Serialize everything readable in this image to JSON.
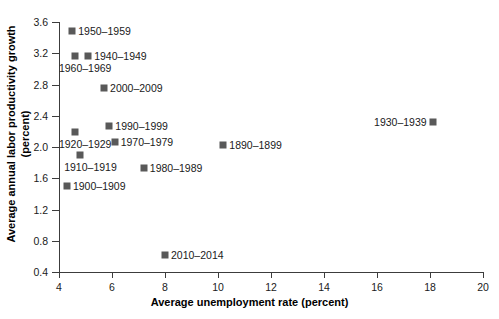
{
  "chart_data": {
    "type": "scatter",
    "title": "",
    "xlabel": "Average unemployment rate (percent)",
    "ylabel": "Average annual labor productivity growth (percent)",
    "xlim": [
      4,
      20
    ],
    "ylim": [
      0.4,
      3.6
    ],
    "xticks": [
      "4",
      "6",
      "8",
      "10",
      "12",
      "14",
      "16",
      "18",
      "20"
    ],
    "xtick_values": [
      4,
      6,
      8,
      10,
      12,
      14,
      16,
      18,
      20
    ],
    "yticks": [
      "0.4",
      "0.8",
      "1.2",
      "1.6",
      "2.0",
      "2.4",
      "2.8",
      "3.2",
      "3.6"
    ],
    "ytick_values": [
      0.4,
      0.8,
      1.2,
      1.6,
      2.0,
      2.4,
      2.8,
      3.2,
      3.6
    ],
    "grid": false,
    "legend": "none",
    "marker_color": "#595959",
    "axis_color": "#3c3c3c",
    "points": [
      {
        "label": "1950–1959",
        "x": 4.5,
        "y": 3.48,
        "label_side": "right"
      },
      {
        "label": "1940–1949",
        "x": 5.1,
        "y": 3.17,
        "label_side": "right"
      },
      {
        "label": "1960–1969",
        "x": 4.6,
        "y": 3.17,
        "label_side": "below"
      },
      {
        "label": "2000–2009",
        "x": 5.7,
        "y": 2.75,
        "label_side": "right"
      },
      {
        "label": "1990–1999",
        "x": 5.9,
        "y": 2.27,
        "label_side": "right"
      },
      {
        "label": "1970–1979",
        "x": 6.1,
        "y": 2.06,
        "label_side": "right"
      },
      {
        "label": "1920–1929",
        "x": 4.6,
        "y": 2.19,
        "label_side": "below"
      },
      {
        "label": "1910–1919",
        "x": 4.8,
        "y": 1.9,
        "label_side": "below"
      },
      {
        "label": "1900–1909",
        "x": 4.3,
        "y": 1.5,
        "label_side": "right"
      },
      {
        "label": "1980–1989",
        "x": 7.2,
        "y": 1.73,
        "label_side": "right"
      },
      {
        "label": "1890–1899",
        "x": 10.2,
        "y": 2.03,
        "label_side": "right"
      },
      {
        "label": "1930–1939",
        "x": 18.1,
        "y": 2.32,
        "label_side": "left"
      },
      {
        "label": "2010–2014",
        "x": 8.0,
        "y": 0.62,
        "label_side": "right"
      }
    ]
  }
}
